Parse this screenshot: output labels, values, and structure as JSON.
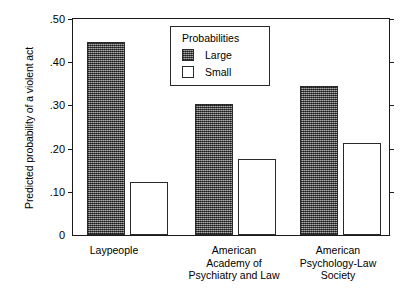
{
  "chart_data": {
    "type": "bar",
    "title": "",
    "xlabel": "",
    "ylabel": "Predicted probability of a violent act",
    "ylim": [
      0,
      0.5
    ],
    "yticks": [
      "0",
      ".10",
      ".20",
      ".30",
      ".40",
      ".50"
    ],
    "ytick_values": [
      0,
      0.1,
      0.2,
      0.3,
      0.4,
      0.5
    ],
    "grid": false,
    "legend": {
      "title": "Probabilities",
      "position": "top-center-inside",
      "entries": [
        "Large",
        "Small"
      ]
    },
    "categories": [
      "Laypeople",
      "American\nAcademy of\nPsychiatry and Law",
      "American\nPsychology-Law\nSociety"
    ],
    "series": [
      {
        "name": "Large",
        "values": [
          0.447,
          0.303,
          0.344
        ]
      },
      {
        "name": "Small",
        "values": [
          0.122,
          0.177,
          0.213
        ]
      }
    ],
    "colors": {
      "large_fill": "#6b6b6b",
      "small_fill": "#ffffff",
      "outline": "#2a2a2a",
      "axis": "#1a1a1a",
      "background": "#ffffff"
    }
  }
}
